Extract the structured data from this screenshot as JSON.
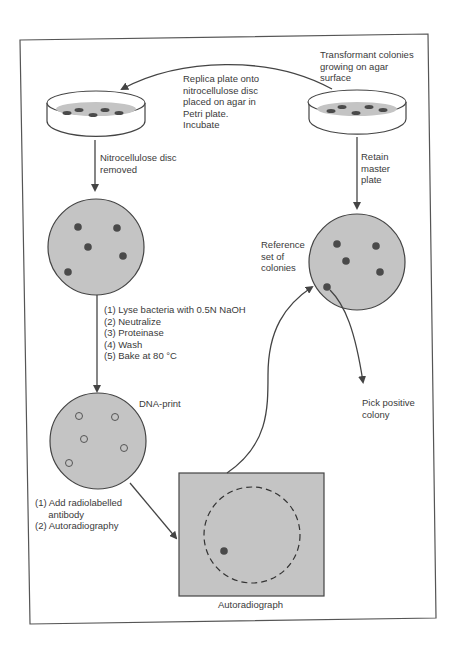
{
  "colors": {
    "ink": "#444444",
    "agar_fill": "#c4c4c4",
    "colony": "#4a4a4a",
    "background": "#ffffff"
  },
  "labels": {
    "transformant": "Transformant colonies\ngrowing on agar\nsurface",
    "replica": "Replica plate onto\nnitrocellulose disc\nplaced on agar in\nPetri plate.\nIncubate",
    "nitro_removed": "Nitrocellulose disc\nremoved",
    "retain_master": "Retain\nmaster\nplate",
    "reference_set": "Reference\nset of\ncolonies",
    "processing_steps": "(1) Lyse bacteria with 0.5N NaOH\n(2) Neutralize\n(3) Proteinase\n(4) Wash\n(5) Bake at 80 °C",
    "dna_print": "DNA-print",
    "pick_positive": "Pick positive\ncolony",
    "antibody_steps": "(1) Add radiolabelled\n     antibody\n(2) Autoradiography",
    "autoradiograph": "Autoradiograph"
  },
  "elements": {
    "replica_dish": {
      "role": "Petri plate with nitrocellulose disc",
      "colonies": 5
    },
    "master_dish": {
      "role": "Master plate with transformant colonies",
      "colonies": 5
    },
    "nitro_disc": {
      "colonies": 5
    },
    "reference_disc": {
      "colonies": 5
    },
    "dna_print_disc": {
      "spots": 5
    },
    "autoradiograph_film": {
      "positive_spots": 1
    }
  }
}
